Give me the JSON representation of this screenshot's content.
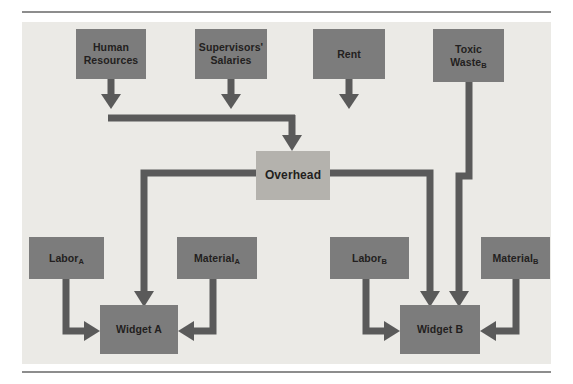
{
  "figure": {
    "panel_color": "#ebeae6",
    "node_color": "#7c7c7c",
    "overhead_color": "#b4b2ad",
    "connector_color": "#5a5a5a",
    "rule_color": "#8d8d8d",
    "text_color": "#231f20"
  },
  "nodes": {
    "human_resources": {
      "line1": "Human",
      "line2": "Resources"
    },
    "supervisors_salaries": {
      "line1": "Supervisors'",
      "line2": "Salaries"
    },
    "rent": {
      "line1": "Rent",
      "line2": ""
    },
    "toxic_waste": {
      "line1": "Toxic",
      "line2": "Waste",
      "sub2": "B"
    },
    "overhead": {
      "label": "Overhead"
    },
    "labor_a": {
      "label": "Labor",
      "sub": "A"
    },
    "material_a": {
      "label": "Material",
      "sub": "A"
    },
    "labor_b": {
      "label": "Labor",
      "sub": "B"
    },
    "material_b": {
      "label": "Material",
      "sub": "B"
    },
    "widget_a": {
      "label": "Widget A"
    },
    "widget_b": {
      "label": "Widget B"
    }
  },
  "connections": [
    {
      "from": "human_resources",
      "to": "overhead",
      "via": "bus"
    },
    {
      "from": "supervisors_salaries",
      "to": "overhead",
      "via": "bus"
    },
    {
      "from": "rent",
      "to": "overhead",
      "via": "bus"
    },
    {
      "from": "toxic_waste",
      "to": "widget_b",
      "via": "direct"
    },
    {
      "from": "overhead",
      "to": "widget_a",
      "via": "left-branch"
    },
    {
      "from": "overhead",
      "to": "widget_b",
      "via": "right-branch"
    },
    {
      "from": "labor_a",
      "to": "widget_a",
      "via": "left-entry"
    },
    {
      "from": "material_a",
      "to": "widget_a",
      "via": "right-entry"
    },
    {
      "from": "labor_b",
      "to": "widget_b",
      "via": "left-entry"
    },
    {
      "from": "material_b",
      "to": "widget_b",
      "via": "right-entry"
    }
  ]
}
